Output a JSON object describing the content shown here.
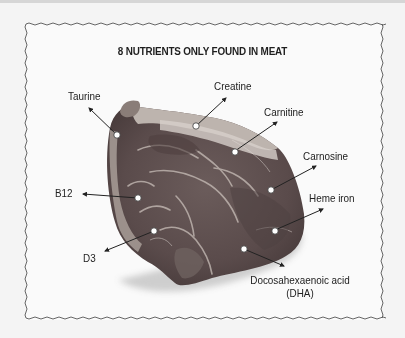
{
  "title": "8 NUTRIENTS ONLY FOUND IN MEAT",
  "image": {
    "subject": "raw beef steak",
    "icon": "meat-steak-photo"
  },
  "frame": {
    "style": "wavy-border",
    "border_color": "#555555"
  },
  "colors": {
    "background": "#f4f4f4",
    "meat_dark": "#5b4a4a",
    "meat_mid": "#7a6a68",
    "fat": "#cfc8c2",
    "marker": "#ffffff",
    "arrow": "#222222"
  },
  "nutrients": [
    {
      "id": "taurine",
      "label": "Taurine"
    },
    {
      "id": "creatine",
      "label": "Creatine"
    },
    {
      "id": "carnitine",
      "label": "Carnitine"
    },
    {
      "id": "carnosine",
      "label": "Carnosine"
    },
    {
      "id": "b12",
      "label": "B12"
    },
    {
      "id": "heme-iron",
      "label": "Heme iron"
    },
    {
      "id": "d3",
      "label": "D3"
    },
    {
      "id": "dha",
      "label": "Docosahexaenoic acid",
      "label_line2": "(DHA)"
    }
  ]
}
